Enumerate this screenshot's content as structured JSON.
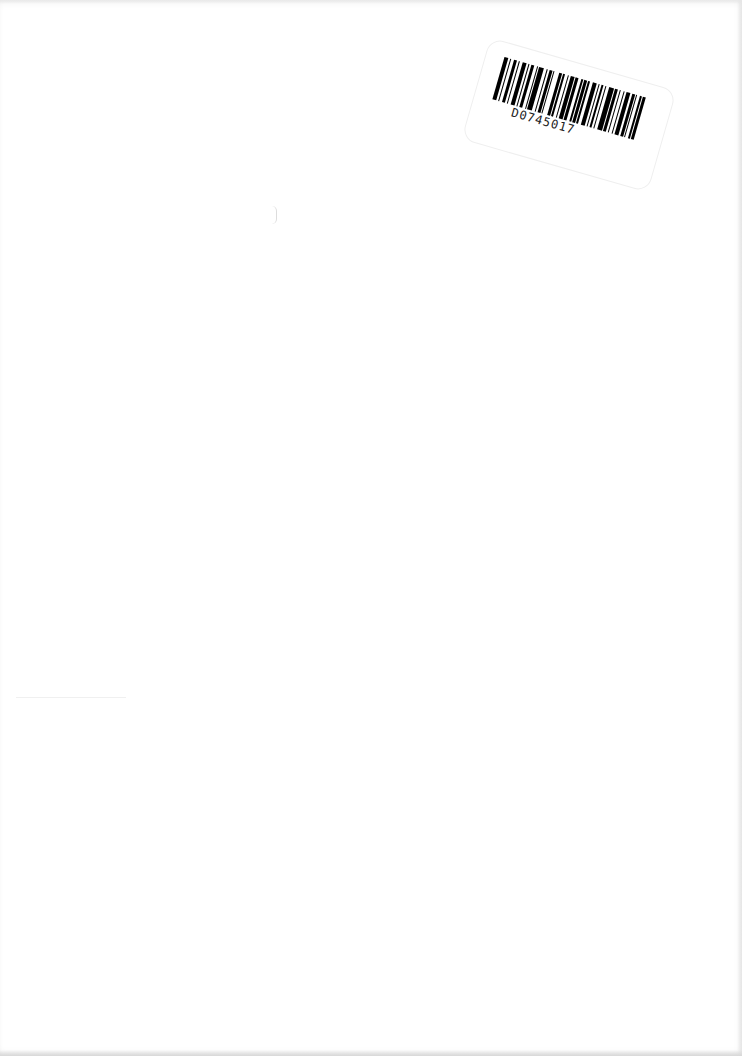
{
  "document": {
    "type": "scanned blank page",
    "label": {
      "barcode_id": "D0745017",
      "barcode_pattern": [
        3,
        1,
        1,
        2,
        2,
        1,
        1,
        2,
        3,
        1,
        1,
        1,
        2,
        2,
        1,
        1,
        3,
        2,
        1,
        1,
        2,
        1,
        1,
        3,
        2,
        1,
        1,
        2,
        1,
        1,
        3,
        1,
        2,
        2,
        1,
        1,
        2,
        1,
        1,
        2,
        3,
        1,
        1,
        1,
        2,
        1,
        1,
        2,
        3,
        1,
        2,
        1,
        1,
        2,
        1,
        1,
        3,
        1,
        2,
        1,
        1,
        2,
        1,
        1,
        2,
        3
      ]
    }
  }
}
